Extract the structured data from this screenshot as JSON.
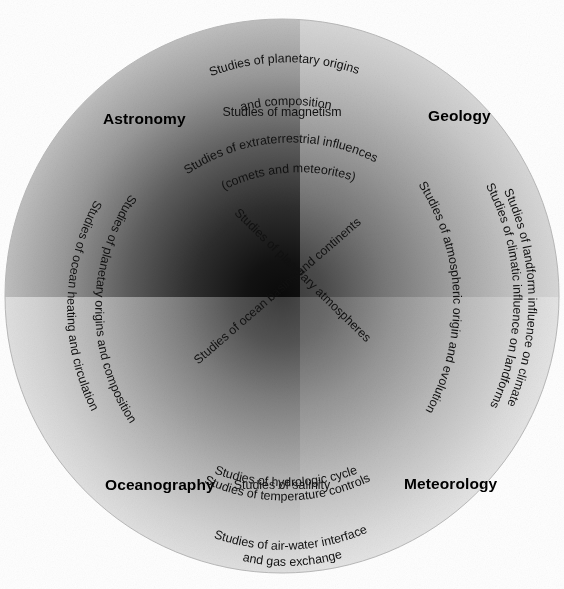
{
  "diagram": {
    "type": "venn-quadrant-circle",
    "shape": "circle",
    "quadrants": [
      {
        "id": "astronomy",
        "label": "Astronomy",
        "position": "top-left"
      },
      {
        "id": "geology",
        "label": "Geology",
        "position": "top-right"
      },
      {
        "id": "oceanography",
        "label": "Oceanography",
        "position": "bottom-left"
      },
      {
        "id": "meteorology",
        "label": "Meteorology",
        "position": "bottom-right"
      }
    ],
    "labels": {
      "astronomy": "Astronomy",
      "geology": "Geology",
      "oceanography": "Oceanography",
      "meteorology": "Meteorology"
    },
    "studies": {
      "top_arc_line1": "Studies of planetary origins",
      "top_arc_line2": "and composition",
      "magnetism": "Studies of magnetism",
      "extraterrestrial_line1": "Studies of extraterrestrial influences",
      "extraterrestrial_line2": "(comets and meteorites)",
      "ocean_basins_continents": "Studies of ocean  basins  and continents",
      "planetary_atmospheres": "Studies of planetary atmospheres",
      "ocean_heating": "Studies of ocean heating and circulation",
      "planetary_origins_composition": "Studies of planetary origins and composition",
      "atmospheric_origin": "Studies of atmospheric origin and evolution",
      "climatic_influence": "Studies of climatic influence on landforms",
      "landform_influence": "Studies of landform influence on climate",
      "hydrologic_cycle": "Studies of hydrologic cycle",
      "temperature_controls": "Studies of temperature controls",
      "salinity": "Studies of salinity",
      "air_water_line1": "Studies of air-water interface",
      "air_water_line2": "and gas exchange"
    },
    "colors": {
      "background": "#ffffff",
      "ink": "#111111",
      "heading": "#000000",
      "quadrant_center_dark": "#0d0d0d",
      "quadrant_edge_light": "#e8e8e8"
    },
    "geometry": {
      "center_x": 282,
      "center_y": 296,
      "radius": 277
    }
  }
}
